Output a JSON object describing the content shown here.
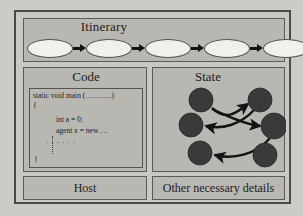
{
  "diagram": {
    "colors": {
      "page_background": "#cdcbc6",
      "frame_border": "#4a4a4a",
      "panel_background": "#b9b7b2",
      "panel_border": "#5a5a58",
      "node_fill": "#f2f0ea",
      "state_node_fill": "#3a3a3a",
      "arrow": "#131313",
      "text": "#1c1c1c"
    }
  },
  "itinerary": {
    "title": "Itinerary",
    "nodes": [
      {
        "label": ""
      },
      {
        "label": ""
      },
      {
        "label": ""
      },
      {
        "label": ""
      },
      {
        "label": ""
      }
    ],
    "arrows": 4
  },
  "code": {
    "title": "Code",
    "lines": [
      "static void main (………..)",
      "{",
      "int a = 0;",
      "agent x = new….",
      ". . . . . .",
      "}"
    ]
  },
  "state": {
    "title": "State",
    "nodes": [
      {
        "id": "n1",
        "cx": 48,
        "cy": 32,
        "r": 12
      },
      {
        "id": "n2",
        "cx": 107,
        "cy": 32,
        "r": 12
      },
      {
        "id": "n3",
        "cx": 38,
        "cy": 57,
        "r": 12
      },
      {
        "id": "n4",
        "cx": 121,
        "cy": 58,
        "r": 13
      },
      {
        "id": "n5",
        "cx": 47,
        "cy": 85,
        "r": 12
      },
      {
        "id": "n6",
        "cx": 112,
        "cy": 87,
        "r": 12
      }
    ],
    "edges": [
      {
        "from": "n1",
        "to": "n2"
      },
      {
        "from": "n2",
        "to": "n3"
      },
      {
        "from": "n1",
        "to": "n4"
      },
      {
        "from": "n4",
        "to": "n5"
      }
    ]
  },
  "host": {
    "label": "Host"
  },
  "other": {
    "label": "Other necessary details"
  }
}
